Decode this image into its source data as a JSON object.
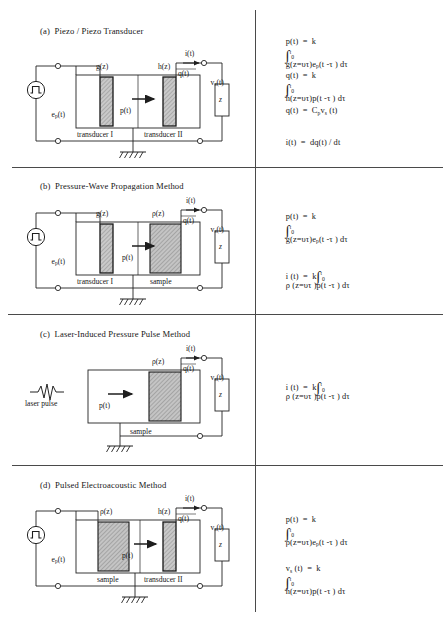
{
  "figure": {
    "type": "diagram",
    "divider_color": "#444444",
    "hatch_color": "#b8b8b8",
    "line_color": "#2a2a2a"
  },
  "panels": [
    {
      "id": "a",
      "title": "(a)  Piezo / Piezo Transducer",
      "source": {
        "symbol": "pulse-source-icon",
        "label_base": "e",
        "label_sub": "p",
        "label_tail": "(t)"
      },
      "blocks": [
        {
          "name": "transducer-1",
          "caption": "transducer I",
          "top_label": "g(z)"
        },
        {
          "name": "transducer-2",
          "caption": "transducer II",
          "top_label": "h(z)"
        }
      ],
      "arrow_label": "p(t)",
      "charge_label": "q(t)",
      "current_label": "i(t)",
      "voltage_label_base": "v",
      "voltage_label_sub": "s",
      "voltage_label_tail": "(t)",
      "impedance_label": "z",
      "ground": "ground-icon",
      "equations": [
        {
          "id": "a-eq1",
          "lhs": "p(t)  =  k",
          "int_upper": "t",
          "int_lower": "0",
          "rhs": "g(z=υτ)e",
          "rhs_sub": "p",
          "rhs_tail": "(t -τ ) dτ"
        },
        {
          "id": "a-eq2",
          "lhs": "q(t)  =  k",
          "int_upper": "t",
          "int_lower": "0",
          "rhs": "h(z=υτ)p(t -τ ) dτ",
          "rhs_sub": "",
          "rhs_tail": ""
        },
        {
          "id": "a-eq3",
          "plain": true,
          "lhs": "q(t)  =  C",
          "lhs_sub": "p",
          "mid": "v",
          "mid_sub": "s",
          "rhs_tail": " (t)"
        },
        {
          "id": "a-eq4",
          "plain": true,
          "lhs": "i(t)  =  dq(t) / dt",
          "lhs_sub": "",
          "mid": "",
          "mid_sub": "",
          "rhs_tail": ""
        }
      ]
    },
    {
      "id": "b",
      "title": "(b)  Pressure-Wave Propagation Method",
      "source": {
        "symbol": "pulse-source-icon",
        "label_base": "e",
        "label_sub": "p",
        "label_tail": "(t)"
      },
      "blocks": [
        {
          "name": "transducer-1",
          "caption": "transducer I",
          "top_label": "g(z)"
        },
        {
          "name": "sample",
          "caption": "sample",
          "top_label": "ρ(z)"
        }
      ],
      "arrow_label": "p(t)",
      "charge_label": "q(t)",
      "current_label": "i(t)",
      "voltage_label_base": "v",
      "voltage_label_sub": "s",
      "voltage_label_tail": "(t)",
      "impedance_label": "z",
      "ground": "ground-icon",
      "equations": [
        {
          "id": "b-eq1",
          "lhs": "p(t)  =  k",
          "int_upper": "t",
          "int_lower": "0",
          "rhs": "g(z=υτ)e",
          "rhs_sub": "p",
          "rhs_tail": "(t -τ ) dτ"
        },
        {
          "id": "b-eq2",
          "lhs": "i (t)  =  k",
          "int_upper": "t",
          "int_lower": "0",
          "rhs": "ρ (z=υτ )p(t -τ ) dτ",
          "rhs_sub": "",
          "rhs_tail": ""
        }
      ]
    },
    {
      "id": "c",
      "title": "(c)  Laser-Induced Pressure Pulse Method",
      "source": {
        "symbol": "laser-pulse-icon",
        "label_base": "laser pulse",
        "label_sub": "",
        "label_tail": ""
      },
      "blocks": [
        {
          "name": "sample",
          "caption": "sample",
          "top_label": "ρ(z)"
        }
      ],
      "arrow_label": "p(t)",
      "charge_label": "q(t)",
      "current_label": "i(t)",
      "voltage_label_base": "v",
      "voltage_label_sub": "s",
      "voltage_label_tail": "(t)",
      "impedance_label": "z",
      "ground": "ground-icon",
      "equations": [
        {
          "id": "c-eq1",
          "lhs": "i (t)  =  k",
          "int_upper": "t",
          "int_lower": "0",
          "rhs": "ρ (z=υτ )p(t -τ ) dτ",
          "rhs_sub": "",
          "rhs_tail": ""
        }
      ]
    },
    {
      "id": "d",
      "title": "(d)  Pulsed Electroacoustic Method",
      "source": {
        "symbol": "pulse-source-icon",
        "label_base": "e",
        "label_sub": "p",
        "label_tail": "(t)"
      },
      "blocks": [
        {
          "name": "sample",
          "caption": "sample",
          "top_label": "ρ(z)"
        },
        {
          "name": "transducer-2",
          "caption": "transducer II",
          "top_label": "h(z)"
        }
      ],
      "arrow_label": "p(t)",
      "charge_label": "q(t)",
      "current_label": "i(t)",
      "voltage_label_base": "v",
      "voltage_label_sub": "s",
      "voltage_label_tail": "(t)",
      "impedance_label": "z",
      "ground": "ground-icon",
      "equations": [
        {
          "id": "d-eq1",
          "lhs": "p(t)  =  k",
          "int_upper": "t",
          "int_lower": "0",
          "rhs": "ρ(z=υτ)e",
          "rhs_sub": "p",
          "rhs_tail": "(t -τ ) dτ"
        },
        {
          "id": "d-eq2",
          "lhs_base": "v",
          "lhs_sub": "s",
          "lhs": " (t)  =  k",
          "int_upper": "t",
          "int_lower": "0",
          "rhs": "h(z=υτ)p(t -τ ) dτ",
          "rhs_sub": "",
          "rhs_tail": ""
        }
      ]
    }
  ]
}
